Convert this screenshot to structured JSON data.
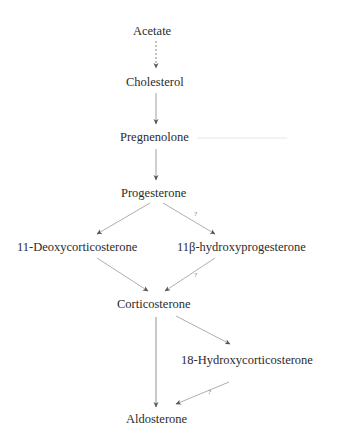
{
  "diagram": {
    "nodes": {
      "acetate": "Acetate",
      "cholesterol": "Cholesterol",
      "pregnenolone": "Pregnenolone",
      "progesterone": "Progesterone",
      "deoxycorticosterone": "11-Deoxycorticosterone",
      "hydroxyprogesterone": "11β-hydroxyprogesterone",
      "corticosterone": "Corticosterone",
      "hydroxycorticosterone": "18-Hydroxycorticosterone",
      "aldosterone": "Aldosterone"
    },
    "uncertain_mark": "?",
    "edges": [
      {
        "from": "Acetate",
        "to": "Cholesterol",
        "style": "dashed"
      },
      {
        "from": "Cholesterol",
        "to": "Pregnenolone",
        "style": "solid"
      },
      {
        "from": "Pregnenolone",
        "to": "Progesterone",
        "style": "solid"
      },
      {
        "from": "Progesterone",
        "to": "11-Deoxycorticosterone",
        "style": "solid"
      },
      {
        "from": "Progesterone",
        "to": "11β-hydroxyprogesterone",
        "style": "solid",
        "label": "?"
      },
      {
        "from": "11-Deoxycorticosterone",
        "to": "Corticosterone",
        "style": "solid"
      },
      {
        "from": "11β-hydroxyprogesterone",
        "to": "Corticosterone",
        "style": "solid",
        "label": "?"
      },
      {
        "from": "Corticosterone",
        "to": "Aldosterone",
        "style": "solid"
      },
      {
        "from": "Corticosterone",
        "to": "18-Hydroxycorticosterone",
        "style": "solid"
      },
      {
        "from": "18-Hydroxycorticosterone",
        "to": "Aldosterone",
        "style": "solid",
        "label": "?"
      }
    ],
    "colors": {
      "arrow": "#8a8a8a",
      "text": "#2b2b2b",
      "faint_line": "#e6e6e6"
    }
  }
}
